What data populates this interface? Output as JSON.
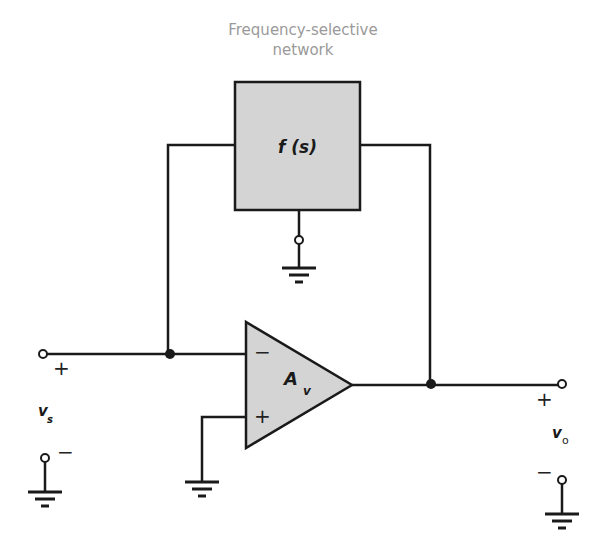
{
  "diagram": {
    "title_line1": "Frequency-selective",
    "title_line2": "network",
    "network_block": {
      "label": "f (s)",
      "fill": "#d4d4d4"
    },
    "amplifier": {
      "label": "A",
      "subscript": "v",
      "inverting_sign": "−",
      "noninverting_sign": "+",
      "fill": "#d4d4d4"
    },
    "input": {
      "label": "v",
      "subscript": "s",
      "plus": "+",
      "minus": "−"
    },
    "output": {
      "label": "v",
      "subscript": "o",
      "plus": "+",
      "minus": "−"
    },
    "colors": {
      "wire": "#1a1a1a",
      "block_fill": "#d4d4d4",
      "caption": "#9a9a9a"
    }
  }
}
